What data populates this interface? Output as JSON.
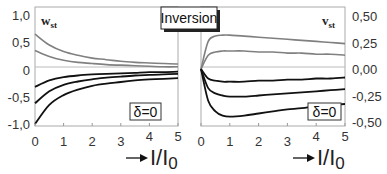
{
  "chart_data": [
    {
      "type": "line",
      "panel": "left",
      "title": "",
      "variable_label": "w",
      "variable_subscript": "st",
      "annotation": "δ=0",
      "xlabel": "I/I0",
      "xlabel_main": "I/I",
      "xlabel_sub": "0",
      "ylabel": "w_st",
      "xlim": [
        0,
        5
      ],
      "ylim": [
        -1.0,
        1.0
      ],
      "x_ticks": [
        "0",
        "1",
        "2",
        "3",
        "4",
        "5"
      ],
      "y_ticks": [
        "1,0",
        "0,5",
        "0",
        "-0,5",
        "-1,0"
      ],
      "grid": false,
      "x": [
        0,
        0.5,
        1,
        1.5,
        2,
        2.5,
        3,
        3.5,
        4,
        4.5,
        5
      ],
      "series": [
        {
          "name": "gray upper",
          "color": "#808080",
          "values": [
            0.65,
            0.45,
            0.33,
            0.26,
            0.21,
            0.18,
            0.15,
            0.13,
            0.12,
            0.11,
            0.1
          ]
        },
        {
          "name": "gray lower",
          "color": "#808080",
          "values": [
            0.35,
            0.24,
            0.17,
            0.13,
            0.11,
            0.09,
            0.08,
            0.07,
            0.06,
            0.05,
            0.05
          ]
        },
        {
          "name": "black top",
          "color": "#111111",
          "values": [
            -0.32,
            -0.2,
            -0.14,
            -0.11,
            -0.09,
            -0.08,
            -0.07,
            -0.06,
            -0.05,
            -0.05,
            -0.04
          ]
        },
        {
          "name": "black middle",
          "color": "#111111",
          "values": [
            -0.62,
            -0.4,
            -0.28,
            -0.22,
            -0.18,
            -0.15,
            -0.13,
            -0.11,
            -0.1,
            -0.09,
            -0.08
          ]
        },
        {
          "name": "black bottom",
          "color": "#111111",
          "values": [
            -1.0,
            -0.65,
            -0.47,
            -0.37,
            -0.3,
            -0.26,
            -0.23,
            -0.2,
            -0.18,
            -0.17,
            -0.16
          ]
        }
      ]
    },
    {
      "type": "line",
      "panel": "right",
      "title": "",
      "variable_label": "v",
      "variable_subscript": "st",
      "annotation": "δ=0",
      "xlabel": "I/I0",
      "xlabel_main": "I/I",
      "xlabel_sub": "0",
      "ylabel": "v_st",
      "xlim": [
        0,
        5
      ],
      "ylim": [
        -0.5,
        0.5
      ],
      "x_ticks": [
        "0",
        "1",
        "2",
        "3",
        "4",
        "5"
      ],
      "y_ticks": [
        "0,50",
        "0,25",
        "0,00",
        "-0,25",
        "-0,50"
      ],
      "y_axis_position": "right",
      "grid": false,
      "x": [
        0,
        0.25,
        0.5,
        0.75,
        1,
        1.5,
        2,
        2.5,
        3,
        3.5,
        4,
        4.5,
        5
      ],
      "series": [
        {
          "name": "gray upper",
          "color": "#808080",
          "values": [
            0.0,
            0.26,
            0.31,
            0.32,
            0.32,
            0.31,
            0.3,
            0.29,
            0.28,
            0.27,
            0.26,
            0.25,
            0.24
          ]
        },
        {
          "name": "gray lower",
          "color": "#808080",
          "values": [
            0.0,
            0.13,
            0.16,
            0.17,
            0.17,
            0.17,
            0.16,
            0.16,
            0.15,
            0.15,
            0.14,
            0.14,
            0.13
          ]
        },
        {
          "name": "black top",
          "color": "#111111",
          "values": [
            0.0,
            -0.09,
            -0.11,
            -0.12,
            -0.12,
            -0.12,
            -0.11,
            -0.11,
            -0.1,
            -0.1,
            -0.09,
            -0.09,
            -0.08
          ]
        },
        {
          "name": "black middle",
          "color": "#111111",
          "values": [
            0.0,
            -0.18,
            -0.23,
            -0.25,
            -0.26,
            -0.26,
            -0.25,
            -0.24,
            -0.23,
            -0.22,
            -0.21,
            -0.2,
            -0.19
          ]
        },
        {
          "name": "black bottom",
          "color": "#111111",
          "values": [
            0.0,
            -0.3,
            -0.4,
            -0.44,
            -0.45,
            -0.44,
            -0.42,
            -0.4,
            -0.38,
            -0.37,
            -0.35,
            -0.34,
            -0.33
          ]
        }
      ]
    }
  ],
  "overlay": {
    "center_label": "Inversion"
  },
  "colors": {
    "gray_curve": "#808080",
    "black_curve": "#111111",
    "frame": "#999999",
    "zero_line": "#bbbbbb"
  }
}
